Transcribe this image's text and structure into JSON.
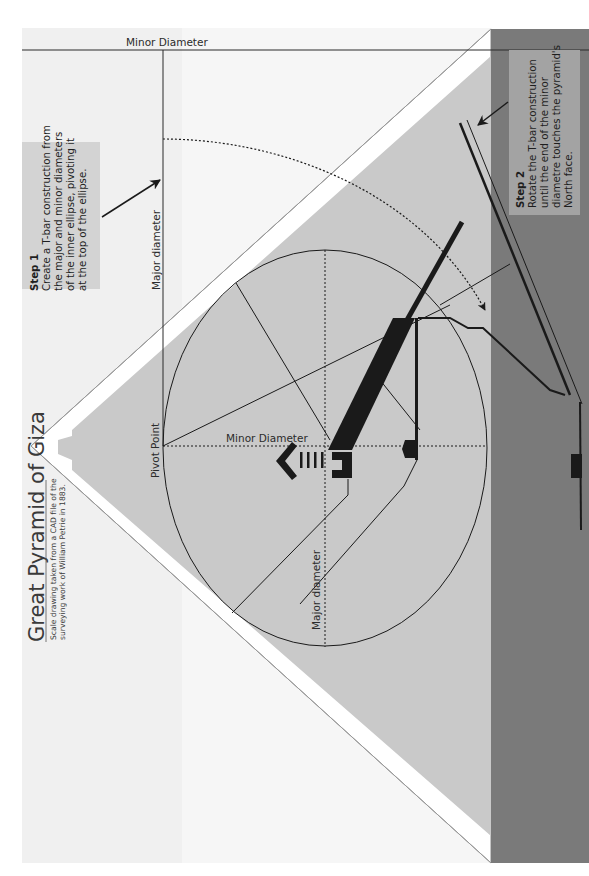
{
  "title": {
    "heading": "Great Pyramid of Giza",
    "subtitle_line1": "Scale drawing taken from a CAD file of the",
    "subtitle_line2": "surveying work of William Petrie in 1883."
  },
  "step1": {
    "heading": "Step 1",
    "lines": [
      "Create a T-bar construction from",
      "the major and minor diameters",
      "of the inner ellipse, pivoting it",
      "at the top of the ellipse."
    ]
  },
  "step2": {
    "heading": "Step 2",
    "lines": [
      "Rotate the T-bar construction",
      "until the end of the minor",
      "diametre touches the pyramid's",
      "North face."
    ]
  },
  "labels": {
    "tbar_minor": "Minor Diameter",
    "tbar_major": "Major diameter",
    "pivot": "Pivot Point",
    "ellipse_minor": "Minor Diameter",
    "ellipse_major": "Major diameter"
  },
  "colors": {
    "paper": "#ffffff",
    "page_tint": "#f1f1f1",
    "pyramid_fill": "#c9c9c9",
    "ground_band": "#7a7a7a",
    "step1_box": "#d3d3d3",
    "step2_box": "#a3a3a3",
    "ink": "#1a1a1a"
  }
}
